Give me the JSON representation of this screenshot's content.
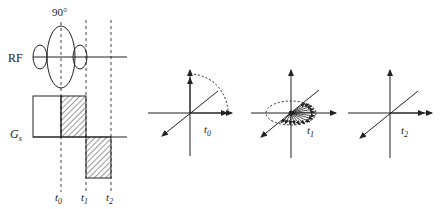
{
  "figure": {
    "colors": {
      "line": "#222222",
      "background": "#ffffff"
    }
  },
  "sequence": {
    "rf_label": "RF",
    "flip_angle_label": "90°",
    "gradient_label_main": "G",
    "gradient_label_sub": "s",
    "time_labels": [
      {
        "main": "t",
        "sub": "0"
      },
      {
        "main": "t",
        "sub": "1"
      },
      {
        "main": "t",
        "sub": "2"
      }
    ]
  },
  "vector_diagrams": [
    {
      "label_main": "t",
      "label_sub": "0",
      "state": "magnetization tipped from z-axis toward transverse plane (90° arc)"
    },
    {
      "label_main": "t",
      "label_sub": "1",
      "state": "spins dephased in transverse plane (fan of vectors)"
    },
    {
      "label_main": "t",
      "label_sub": "2",
      "state": "spins rephased along one transverse axis"
    }
  ]
}
